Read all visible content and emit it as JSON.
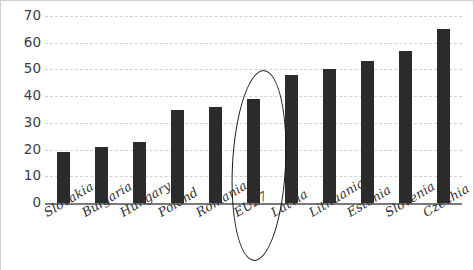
{
  "chart_data": {
    "type": "bar",
    "title": "",
    "subtitle": "",
    "xlabel": "",
    "ylabel": "",
    "ylim": [
      0,
      70
    ],
    "ytick_step": 10,
    "yticks": [
      "70",
      "60",
      "50",
      "40",
      "30",
      "20",
      "10",
      "0"
    ],
    "grid": true,
    "grid_style": "dashed-horizontal",
    "legend": "none",
    "categories": [
      "Slovakia",
      "Bulgaria",
      "Hungary",
      "Poland",
      "Romania",
      "EU27",
      "Latvia",
      "Lithuania",
      "Estonia",
      "Slovenia",
      "Czechia"
    ],
    "values": [
      19,
      21,
      23,
      35,
      36,
      39,
      48,
      50,
      53,
      57,
      65
    ],
    "bar_color": "#2b2b2b",
    "grid_color": "#d2d2d2",
    "axis_color": "#7a7a7a",
    "annotations": [
      {
        "type": "ellipse",
        "name": "eu27-highlight-ellipse",
        "target_category": "EU27",
        "target_value": 39,
        "color": "#1a1a1a"
      }
    ]
  },
  "axis": {
    "y_ticks": [
      {
        "label": "70",
        "value": 70
      },
      {
        "label": "60",
        "value": 60
      },
      {
        "label": "50",
        "value": 50
      },
      {
        "label": "40",
        "value": 40
      },
      {
        "label": "30",
        "value": 30
      },
      {
        "label": "20",
        "value": 20
      },
      {
        "label": "10",
        "value": 10
      },
      {
        "label": "0",
        "value": 0
      }
    ]
  }
}
